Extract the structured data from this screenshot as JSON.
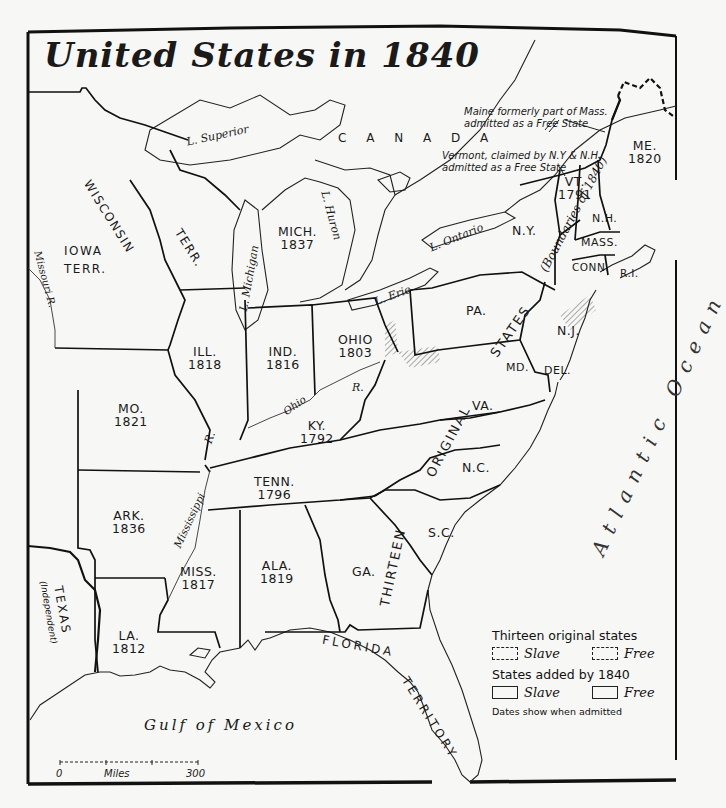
{
  "title": "United States in 1840",
  "states": [
    {
      "name": "ME.",
      "year": "1820"
    },
    {
      "name": "VT.",
      "year": "1791"
    },
    {
      "name": "N.H.",
      "year": ""
    },
    {
      "name": "MASS.",
      "year": ""
    },
    {
      "name": "CONN.",
      "year": ""
    },
    {
      "name": "R.I.",
      "year": ""
    },
    {
      "name": "N.Y.",
      "year": ""
    },
    {
      "name": "PA.",
      "year": ""
    },
    {
      "name": "N.J.",
      "year": ""
    },
    {
      "name": "MD.",
      "year": ""
    },
    {
      "name": "DEL.",
      "year": ""
    },
    {
      "name": "VA.",
      "year": ""
    },
    {
      "name": "N.C.",
      "year": ""
    },
    {
      "name": "S.C.",
      "year": ""
    },
    {
      "name": "GA.",
      "year": ""
    },
    {
      "name": "MICH.",
      "year": "1837"
    },
    {
      "name": "OHIO",
      "year": "1803"
    },
    {
      "name": "IND.",
      "year": "1816"
    },
    {
      "name": "ILL.",
      "year": "1818"
    },
    {
      "name": "MO.",
      "year": "1821"
    },
    {
      "name": "KY.",
      "year": "1792"
    },
    {
      "name": "TENN.",
      "year": "1796"
    },
    {
      "name": "ARK.",
      "year": "1836"
    },
    {
      "name": "MISS.",
      "year": "1817"
    },
    {
      "name": "ALA.",
      "year": "1819"
    },
    {
      "name": "LA.",
      "year": "1812"
    }
  ],
  "territories": {
    "wisconsin": "WISCONSIN",
    "wisconsin_terr": "TERR.",
    "iowa": "IOWA",
    "iowa_terr": "TERR.",
    "florida": "FLORIDA",
    "florida_terr": "TERRITORY",
    "texas": "TEXAS",
    "texas_note": "(Independent)",
    "canada": "C A N A D A"
  },
  "band": {
    "thirteen": "THIRTEEN",
    "original": "ORIGINAL",
    "states": "STATES",
    "boundaries": "(Boundaries of 1840)"
  },
  "water": {
    "superior": "L. Superior",
    "michigan": "L. Michigan",
    "huron": "L. Huron",
    "erie": "L. Erie",
    "ontario": "L. Ontario",
    "missouri_r": "Missouri R.",
    "ohio_r": "Ohio",
    "ohio_r2": "R.",
    "miss_r": "Mississippi",
    "miss_r2": "R.",
    "gulf": "Gulf of Mexico",
    "atlantic": "Atlantic Ocean"
  },
  "notes": {
    "maine_1": "Maine formerly part of Mass.",
    "maine_2": "admitted as a Free State",
    "vermont_1": "Vermont, claimed by N.Y & N.H.",
    "vermont_2": "admitted as a Free State"
  },
  "legend": {
    "heading_original": "Thirteen original states",
    "heading_added": "States added by 1840",
    "slave": "Slave",
    "free": "Free",
    "footnote": "Dates show when admitted"
  },
  "scale": {
    "start": "0",
    "unit": "Miles",
    "end": "300"
  }
}
